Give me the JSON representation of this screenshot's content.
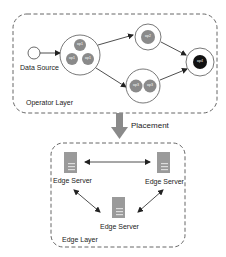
{
  "operator_layer": {
    "label": "Operator Layer",
    "source": {
      "label": "Data Source"
    },
    "nodes": [
      {
        "id": "n1",
        "operators": [
          "op1",
          "op1",
          "op1"
        ]
      },
      {
        "id": "n2",
        "operators": [
          "op2"
        ]
      },
      {
        "id": "n3",
        "operators": [
          "op3",
          "op3"
        ]
      },
      {
        "id": "n4",
        "operators": [
          "op4"
        ]
      }
    ],
    "edges": [
      [
        "source",
        "n1"
      ],
      [
        "n1",
        "n2"
      ],
      [
        "n1",
        "n3"
      ],
      [
        "n2",
        "n4"
      ],
      [
        "n3",
        "n4"
      ]
    ]
  },
  "placement": {
    "label": "Placement"
  },
  "edge_layer": {
    "label": "Edge Layer",
    "servers": [
      {
        "label": "Edge Server"
      },
      {
        "label": "Edge Server"
      },
      {
        "label": "Edge Server"
      }
    ]
  },
  "colors": {
    "operator_fill": "#8a8a8a",
    "sink_fill": "#111111",
    "server_fill": "#9a9a9a",
    "placement_arrow": "#8a8a8a"
  }
}
